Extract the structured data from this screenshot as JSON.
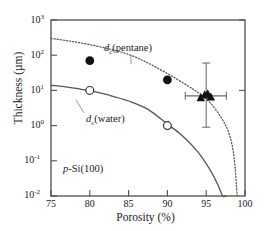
{
  "chart_data": {
    "type": "line",
    "title": "",
    "xlabel": "Porosity (%)",
    "ylabel": "Thickness (µm)",
    "xlim": [
      75,
      100
    ],
    "ylim": [
      0.01,
      1000
    ],
    "yscale": "log",
    "xscale": "linear",
    "grid": false,
    "legend_position": "inline-annotations",
    "xticks": [
      "75",
      "80",
      "85",
      "90",
      "95",
      "100"
    ],
    "xtick_values": [
      75,
      80,
      85,
      90,
      95,
      100
    ],
    "ytick_exponents": [
      "3",
      "2",
      "1",
      "0",
      "-1",
      "-2"
    ],
    "ytick_values": [
      1000,
      100,
      10,
      1,
      0.1,
      0.01
    ],
    "annotations": [
      {
        "name": "pentane-curve-label",
        "base": "d",
        "sub": "c",
        "paren": "(pentane)"
      },
      {
        "name": "water-curve-label",
        "base": "d",
        "sub": "c",
        "paren": "(water)"
      },
      {
        "name": "sample-label",
        "ital": "p",
        "rest": "-Si(100)"
      }
    ],
    "series": [
      {
        "name": "d_c(pentane)",
        "style": "dotted",
        "x": [
          75,
          77.5,
          80,
          82.5,
          85,
          87.5,
          90,
          92.5,
          94,
          95.5,
          97,
          98,
          98.6,
          99
        ],
        "values": [
          300,
          250,
          200,
          150,
          105,
          60,
          30,
          14,
          8.5,
          4.5,
          1.6,
          0.55,
          0.12,
          0.01
        ]
      },
      {
        "name": "d_c(water)",
        "style": "solid",
        "x": [
          75,
          77.5,
          80,
          82.5,
          85,
          87.5,
          90,
          92,
          94,
          95.5,
          96.5,
          97.1,
          97.45,
          97.6
        ],
        "values": [
          14,
          12,
          9.8,
          7.3,
          5.0,
          2.9,
          1.1,
          0.5,
          0.17,
          0.055,
          0.021,
          0.008,
          0.0025,
          0.01
        ]
      },
      {
        "name": "filled-circles",
        "style": "marker",
        "marker": "filled-circle",
        "x": [
          80,
          90
        ],
        "values": [
          70,
          20
        ]
      },
      {
        "name": "open-circles",
        "style": "marker",
        "marker": "open-circle",
        "x": [
          80,
          90
        ],
        "values": [
          10,
          1.0
        ]
      },
      {
        "name": "filled-triangles",
        "style": "marker",
        "marker": "filled-triangle",
        "x": [
          94.3,
          94.8,
          95.2,
          95.6
        ],
        "values": [
          6.2,
          7.5,
          8.0,
          6.5
        ]
      }
    ],
    "error_bars": [
      {
        "name": "triangle-error-bar",
        "x": 95.0,
        "y": 7.0,
        "x_low": 92.3,
        "x_high": 97.6,
        "y_low": 0.9,
        "y_high": 60.0
      }
    ]
  },
  "colors": {
    "axis": "#4d4d4d",
    "curve": "#555555",
    "marker": "#111111",
    "text": "#1a1a1a",
    "background": "#ffffff"
  }
}
